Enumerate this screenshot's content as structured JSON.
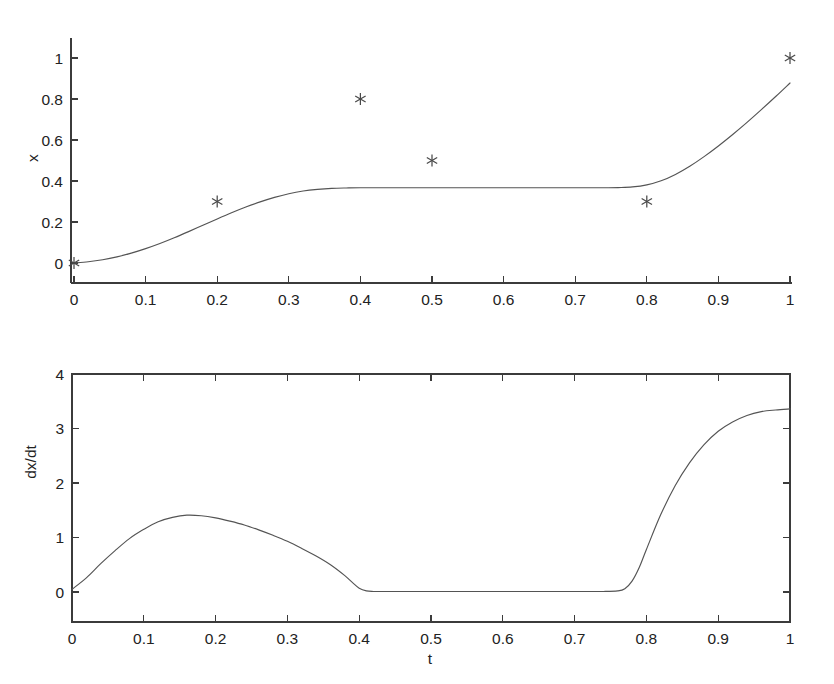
{
  "figure": {
    "background": "#ffffff",
    "line_color": "#545454",
    "axis_color": "#3b3b3b",
    "text_color": "#222222"
  },
  "chart_data": [
    {
      "type": "line",
      "id": "position-plot",
      "title": "",
      "xlabel": "",
      "ylabel": "x",
      "xlim": [
        0,
        1
      ],
      "ylim": [
        -0.1,
        1.1
      ],
      "grid": false,
      "legend": "none",
      "xticks": [
        0,
        0.1,
        0.2,
        0.3,
        0.4,
        0.5,
        0.6,
        0.7,
        0.8,
        0.9,
        1
      ],
      "xticklabels": [
        "0",
        "0.1",
        "0.2",
        "0.3",
        "0.4",
        "0.5",
        "0.6",
        "0.7",
        "0.8",
        "0.9",
        "1"
      ],
      "yticks": [
        0,
        0.2,
        0.4,
        0.6,
        0.8,
        1
      ],
      "yticklabels": [
        "0",
        "0.2",
        "0.4",
        "0.6",
        "0.8",
        "1"
      ],
      "series": [
        {
          "name": "x(t) fitted curve",
          "style": "solid-line",
          "x": [
            0,
            0.02,
            0.04,
            0.06,
            0.08,
            0.1,
            0.12,
            0.14,
            0.16,
            0.18,
            0.2,
            0.22,
            0.24,
            0.26,
            0.28,
            0.3,
            0.32,
            0.34,
            0.36,
            0.38,
            0.4,
            0.45,
            0.5,
            0.55,
            0.6,
            0.65,
            0.7,
            0.72,
            0.74,
            0.76,
            0.78,
            0.8,
            0.82,
            0.84,
            0.86,
            0.88,
            0.9,
            0.92,
            0.94,
            0.96,
            0.98,
            1.0
          ],
          "y": [
            0.0,
            0.006,
            0.016,
            0.03,
            0.048,
            0.07,
            0.095,
            0.123,
            0.153,
            0.184,
            0.215,
            0.245,
            0.273,
            0.298,
            0.32,
            0.338,
            0.351,
            0.359,
            0.364,
            0.366,
            0.367,
            0.367,
            0.367,
            0.367,
            0.367,
            0.367,
            0.367,
            0.367,
            0.367,
            0.368,
            0.371,
            0.381,
            0.401,
            0.432,
            0.472,
            0.519,
            0.571,
            0.627,
            0.686,
            0.748,
            0.812,
            0.878
          ]
        },
        {
          "name": "data points",
          "style": "asterisk-markers",
          "x": [
            0,
            0.2,
            0.4,
            0.5,
            0.8,
            1.0
          ],
          "y": [
            0.0,
            0.3,
            0.8,
            0.5,
            0.3,
            1.0
          ]
        }
      ]
    },
    {
      "type": "line",
      "id": "derivative-plot",
      "title": "",
      "xlabel": "t",
      "ylabel": "dx/dt",
      "xlim": [
        0,
        1
      ],
      "ylim": [
        -0.88,
        4
      ],
      "grid": false,
      "legend": "none",
      "box": true,
      "xticks": [
        0,
        0.1,
        0.2,
        0.3,
        0.4,
        0.5,
        0.6,
        0.7,
        0.8,
        0.9,
        1
      ],
      "xticklabels": [
        "0",
        "0.1",
        "0.2",
        "0.3",
        "0.4",
        "0.5",
        "0.6",
        "0.7",
        "0.8",
        "0.9",
        "1"
      ],
      "yticks": [
        0,
        1,
        2,
        3,
        4
      ],
      "yticklabels": [
        "0",
        "1",
        "2",
        "3",
        "4"
      ],
      "series": [
        {
          "name": "dx/dt curve",
          "style": "solid-line",
          "x": [
            0,
            0.02,
            0.04,
            0.06,
            0.08,
            0.1,
            0.12,
            0.14,
            0.16,
            0.18,
            0.2,
            0.22,
            0.24,
            0.26,
            0.28,
            0.3,
            0.32,
            0.34,
            0.36,
            0.38,
            0.39,
            0.4,
            0.41,
            0.42,
            0.45,
            0.5,
            0.55,
            0.6,
            0.65,
            0.7,
            0.74,
            0.76,
            0.77,
            0.78,
            0.79,
            0.8,
            0.82,
            0.84,
            0.86,
            0.88,
            0.9,
            0.92,
            0.94,
            0.96,
            0.98,
            1.0
          ],
          "y": [
            0.05,
            0.26,
            0.52,
            0.76,
            0.98,
            1.15,
            1.29,
            1.37,
            1.41,
            1.4,
            1.36,
            1.3,
            1.23,
            1.14,
            1.04,
            0.93,
            0.8,
            0.66,
            0.5,
            0.3,
            0.18,
            0.07,
            0.02,
            0.01,
            0.01,
            0.01,
            0.01,
            0.01,
            0.01,
            0.01,
            0.01,
            0.02,
            0.06,
            0.2,
            0.45,
            0.78,
            1.42,
            1.95,
            2.37,
            2.7,
            2.95,
            3.12,
            3.24,
            3.31,
            3.34,
            3.36
          ]
        }
      ]
    }
  ]
}
